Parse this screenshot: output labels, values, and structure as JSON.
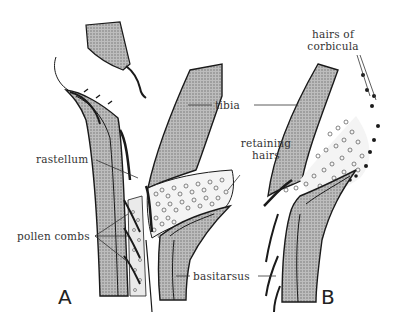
{
  "figure": {
    "panels": [
      {
        "id": "A",
        "label": "A"
      },
      {
        "id": "B",
        "label": "B"
      }
    ],
    "labels": {
      "rastellum": "rastellum",
      "pollen_combs": "pollen combs",
      "tibia": "tibia",
      "retaining_hairs_line1": "retaining",
      "retaining_hairs_line2": "hairs",
      "hairs_of_corbicula_line1": "hairs of",
      "hairs_of_corbicula_line2": "corbicula",
      "basitarsus": "basitarsus"
    },
    "colors": {
      "fill": "#a8a8a8",
      "outline": "#1a1a1a",
      "leader": "#333333"
    }
  }
}
